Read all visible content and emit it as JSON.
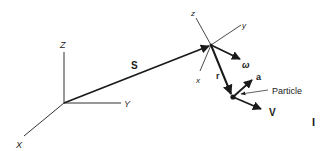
{
  "diagram": {
    "fixed_frame": {
      "axes": {
        "z": "Z",
        "y": "Y",
        "x": "X"
      }
    },
    "moving_frame": {
      "axes": {
        "z": "z",
        "y": "y",
        "x": "x"
      }
    },
    "vectors": {
      "S": "S",
      "r": "r",
      "omega": "ω",
      "a": "a",
      "V": "V"
    },
    "particle_label": "Particle",
    "corner_mark": "I",
    "colors": {
      "ink": "#1a1a1a",
      "background": "#ffffff"
    }
  }
}
